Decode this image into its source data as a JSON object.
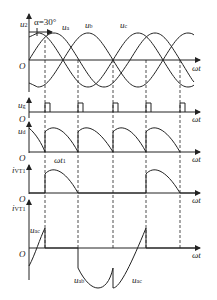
{
  "figure": {
    "alpha_label": "α=30°",
    "origin_label": "O",
    "x_axis_label": "ωt",
    "wt1_label": "ωt",
    "wt1_sub": "1",
    "panels": [
      {
        "id": "u2",
        "ylabel": "u",
        "ylabel_sub": "2",
        "curves": [
          {
            "label": "u",
            "sub": "a"
          },
          {
            "label": "u",
            "sub": "b"
          },
          {
            "label": "u",
            "sub": "c"
          }
        ]
      },
      {
        "id": "ug",
        "ylabel": "u",
        "ylabel_sub": "g"
      },
      {
        "id": "ud",
        "ylabel": "u",
        "ylabel_sub": "d"
      },
      {
        "id": "ivt1",
        "ylabel": "i",
        "ylabel_sub": "VT1"
      },
      {
        "id": "uvt1",
        "ylabel": "i",
        "ylabel_sub": "VT1",
        "curves": [
          {
            "label": "u",
            "sub": "ac"
          },
          {
            "label": "u",
            "sub": "ab"
          },
          {
            "label": "u",
            "sub": "ac"
          }
        ]
      }
    ]
  }
}
